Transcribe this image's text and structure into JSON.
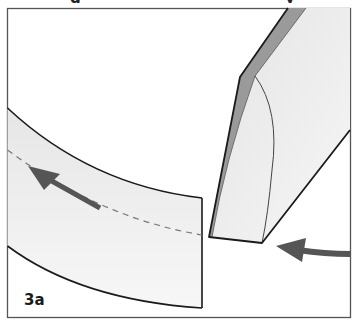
{
  "figure": {
    "label": "3a",
    "title_fragment": {
      "partial_glyphs": [
        "g",
        "y"
      ]
    },
    "colors": {
      "frame": "#555555",
      "outline": "#1a1a1a",
      "band_fill": "#ececec",
      "blade_face": "#eeeeee",
      "blade_bevel": "#9a9a9a",
      "arrow": "#555555",
      "dashed_line": "#777777"
    },
    "elements": {
      "curved_strip": "curved-strip",
      "cut_line": "dashed-cut-line",
      "strip_arrow": "arrow-left-up",
      "blade": "knife-blade",
      "blade_arrow": "arrow-left-curved"
    }
  }
}
